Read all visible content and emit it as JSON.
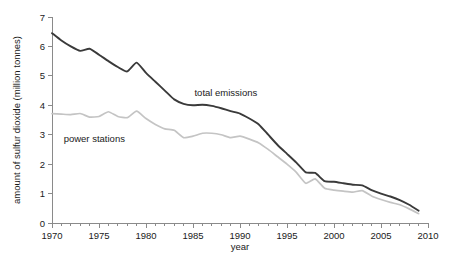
{
  "chart_data": {
    "type": "line",
    "title": "",
    "xlabel": "year",
    "ylabel": "amount of sulfur dioxide (million tonnes)",
    "xlim": [
      1970,
      2010
    ],
    "ylim": [
      0,
      7
    ],
    "grid": false,
    "legend_position": "inline-annotations",
    "x_major_ticks": [
      1970,
      1975,
      1980,
      1985,
      1990,
      1995,
      2000,
      2005,
      2010
    ],
    "x_major_tick_labels": [
      "1970",
      "1975",
      "1980",
      "1985",
      "1990",
      "1995",
      "2000",
      "2005",
      "2010"
    ],
    "x_minor_tick_interval": 1,
    "y_ticks": [
      0,
      1,
      2,
      3,
      4,
      5,
      6,
      7
    ],
    "y_tick_labels": [
      "0",
      "1",
      "2",
      "3",
      "4",
      "5",
      "6",
      "7"
    ],
    "x": [
      1970,
      1971,
      1972,
      1973,
      1974,
      1975,
      1976,
      1977,
      1978,
      1979,
      1980,
      1981,
      1982,
      1983,
      1984,
      1985,
      1986,
      1987,
      1988,
      1989,
      1990,
      1991,
      1992,
      1993,
      1994,
      1995,
      1996,
      1997,
      1998,
      1999,
      2000,
      2001,
      2002,
      2003,
      2004,
      2005,
      2006,
      2007,
      2008,
      2009
    ],
    "series": [
      {
        "name": "total emissions",
        "color": "#3a3a3a",
        "width": 1.9,
        "label_x": 1988.5,
        "label_y": 4.3,
        "values": [
          6.45,
          6.2,
          6.0,
          5.85,
          5.92,
          5.72,
          5.5,
          5.3,
          5.15,
          5.45,
          5.1,
          4.8,
          4.5,
          4.2,
          4.05,
          4.0,
          4.02,
          3.98,
          3.9,
          3.8,
          3.72,
          3.55,
          3.35,
          3.0,
          2.65,
          2.35,
          2.05,
          1.72,
          1.7,
          1.42,
          1.4,
          1.35,
          1.3,
          1.28,
          1.12,
          1.0,
          0.9,
          0.78,
          0.62,
          0.42
        ]
      },
      {
        "name": "power stations",
        "color": "#c4c4c4",
        "width": 1.7,
        "label_x": 1974.5,
        "label_y": 2.75,
        "values": [
          3.72,
          3.7,
          3.68,
          3.72,
          3.6,
          3.62,
          3.78,
          3.62,
          3.58,
          3.8,
          3.55,
          3.35,
          3.2,
          3.15,
          2.9,
          2.95,
          3.05,
          3.05,
          3.0,
          2.9,
          2.95,
          2.85,
          2.72,
          2.5,
          2.25,
          2.0,
          1.72,
          1.35,
          1.5,
          1.18,
          1.12,
          1.08,
          1.05,
          1.1,
          0.92,
          0.8,
          0.7,
          0.62,
          0.48,
          0.32
        ]
      }
    ]
  },
  "colors": {
    "total_emissions": "#3a3a3a",
    "power_stations": "#c4c4c4",
    "axis": "#8a8a8a",
    "text": "#1a1a1a",
    "background": "#ffffff"
  }
}
